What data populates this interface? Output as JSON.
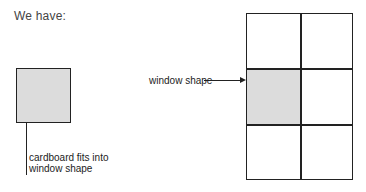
{
  "heading": "We have:",
  "cardboard": {
    "caption_line1": "cardboard fits into",
    "caption_line2": "window shape",
    "fill_color": "#dcdcdc"
  },
  "grid": {
    "rows": 3,
    "cols": 2,
    "highlighted_cell": {
      "row": 2,
      "col": 1
    },
    "label": "window shape",
    "fill_color": "#dcdcdc"
  }
}
